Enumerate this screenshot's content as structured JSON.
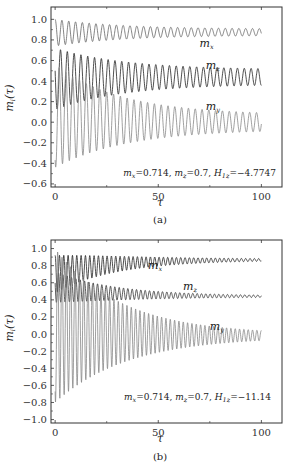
{
  "chart_data": [
    {
      "type": "line",
      "panel_label": "(a)",
      "xlabel": "τ",
      "ylabel": "m_i(τ)",
      "xlim": [
        -2,
        110
      ],
      "ylim": [
        -0.63,
        1.12
      ],
      "xticks": [
        0,
        50,
        100
      ],
      "yticks": [
        -0.6,
        -0.4,
        -0.2,
        0.0,
        0.2,
        0.4,
        0.6,
        0.8,
        1.0
      ],
      "ytick_labels": [
        "−0.6",
        "−0.4",
        "−0.2",
        "0.0",
        "0.2",
        "0.4",
        "0.6",
        "0.8",
        "1.0"
      ],
      "xtick_labels": [
        "0",
        "50",
        "100"
      ],
      "annotation": "m_x=0.714, m_z=0.7, H_1z=−4.7747",
      "annotation_parts": {
        "mx": "=0.714, ",
        "mz": "=0.7, ",
        "H": "=−4.7747"
      },
      "series": [
        {
          "name": "m_x",
          "color": "#666666",
          "center_start": 0.87,
          "center_end": 0.875,
          "amp_start": 0.13,
          "amp_end": 0.03,
          "period": 3.3,
          "label_pos": [
            70,
            0.73
          ]
        },
        {
          "name": "m_z",
          "color": "#222222",
          "center_start": 0.42,
          "center_end": 0.44,
          "amp_start": 0.3,
          "amp_end": 0.07,
          "period": 3.3,
          "label_pos": [
            73,
            0.52
          ]
        },
        {
          "name": "m_y",
          "color": "#888888",
          "center_start": 0.06,
          "center_end": 0.0,
          "amp_start": 0.5,
          "amp_end": 0.07,
          "period": 3.3,
          "label_pos": [
            73,
            0.12
          ]
        }
      ],
      "grid": false
    },
    {
      "type": "line",
      "panel_label": "(b)",
      "xlabel": "τ",
      "ylabel": "m_i(τ)",
      "xlim": [
        -2,
        110
      ],
      "ylim": [
        -1.04,
        1.1
      ],
      "xticks": [
        0,
        50,
        100
      ],
      "yticks": [
        -1.0,
        -0.8,
        -0.6,
        -0.4,
        -0.2,
        0.0,
        0.2,
        0.4,
        0.6,
        0.8,
        1.0
      ],
      "ytick_labels": [
        "−1.0",
        "−0.8",
        "−0.6",
        "−0.4",
        "−0.2",
        "0.0",
        "0.2",
        "0.4",
        "0.6",
        "0.8",
        "1.0"
      ],
      "xtick_labels": [
        "0",
        "50",
        "100"
      ],
      "annotation": "m_x=0.714, m_z=0.7, H_1z=−11.14",
      "annotation_parts": {
        "mx": "=0.714, ",
        "mz": "=0.7, ",
        "H": "=−11.14"
      },
      "series": [
        {
          "name": "m_x",
          "color": "#222222",
          "center_start": 0.7,
          "center_end": 0.87,
          "amp_start": 0.22,
          "amp_end": 0.005,
          "period": 2.1,
          "label_pos": [
            45,
            0.76
          ]
        },
        {
          "name": "m_z",
          "color": "#333333",
          "center_start": 0.55,
          "center_end": 0.44,
          "amp_start": 0.18,
          "amp_end": 0.005,
          "period": 2.1,
          "label_pos": [
            62,
            0.52
          ]
        },
        {
          "name": "m_y",
          "color": "#888888",
          "center_start": 0.1,
          "center_end": -0.02,
          "amp_start": 0.9,
          "amp_end": 0.015,
          "period": 2.1,
          "label_pos": [
            75,
            0.05
          ]
        }
      ],
      "grid": false
    }
  ]
}
